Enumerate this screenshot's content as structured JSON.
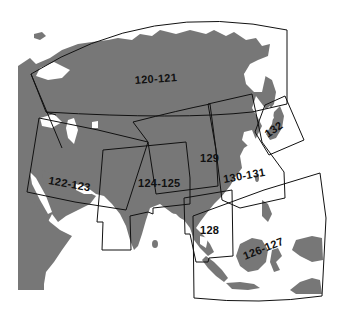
{
  "map": {
    "title": "Index map of Asia",
    "land_color": "#777777",
    "water_color": "#ffffff",
    "frame_color": "#111111",
    "panels": [
      {
        "id": "p120",
        "label": "120-121",
        "x": 127,
        "y": 82,
        "rotate": -4
      },
      {
        "id": "p122",
        "label": "122-123",
        "x": 47,
        "y": 185,
        "rotate": 10
      },
      {
        "id": "p124",
        "label": "124-125",
        "x": 138,
        "y": 185,
        "rotate": 0
      },
      {
        "id": "p129",
        "label": "129",
        "x": 201,
        "y": 160,
        "rotate": 0
      },
      {
        "id": "p130",
        "label": "130-131",
        "x": 225,
        "y": 181,
        "rotate": -10
      },
      {
        "id": "p132",
        "label": "132",
        "x": 267,
        "y": 136,
        "rotate": -35
      },
      {
        "id": "p128",
        "label": "128",
        "x": 199,
        "y": 232,
        "rotate": 0
      },
      {
        "id": "p126",
        "label": "126-127",
        "x": 246,
        "y": 252,
        "rotate": -22
      }
    ]
  }
}
